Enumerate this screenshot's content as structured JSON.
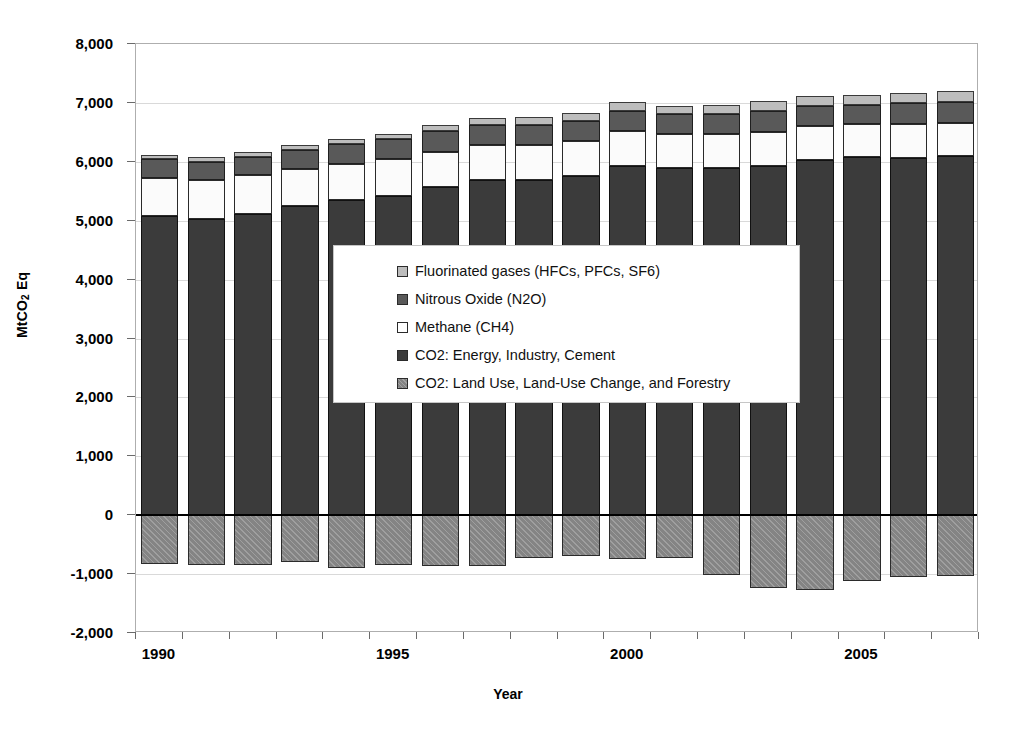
{
  "chart_data": {
    "type": "bar",
    "subtype": "stacked-bar-with-negative",
    "title": "",
    "xlabel": "Year",
    "ylabel": "MtCO2 Eq",
    "ylim": [
      -2000,
      8000
    ],
    "ytick_step": 1000,
    "ytick_labels": [
      "8,000",
      "7,000",
      "6,000",
      "5,000",
      "4,000",
      "3,000",
      "2,000",
      "1,000",
      "0",
      "-1,000",
      "-2,000"
    ],
    "ytick_values": [
      8000,
      7000,
      6000,
      5000,
      4000,
      3000,
      2000,
      1000,
      0,
      -1000,
      -2000
    ],
    "xtick_labels": [
      "1990",
      "1995",
      "2000",
      "2005"
    ],
    "xtick_values": [
      1990,
      1995,
      2000,
      2005
    ],
    "grid": true,
    "legend_position": "center",
    "categories": [
      1990,
      1991,
      1992,
      1993,
      1994,
      1995,
      1996,
      1997,
      1998,
      1999,
      2000,
      2001,
      2002,
      2003,
      2004,
      2005,
      2006,
      2007
    ],
    "series": [
      {
        "name": "CO2: Energy, Industry, Cement",
        "key": "co2_energy",
        "color": "#3b3b3b",
        "values": [
          5080,
          5030,
          5110,
          5250,
          5350,
          5420,
          5570,
          5690,
          5690,
          5760,
          5930,
          5900,
          5890,
          5930,
          6030,
          6080,
          6070,
          6100
        ]
      },
      {
        "name": "Methane (CH4)",
        "key": "ch4",
        "color": "#fbfbfb",
        "values": [
          650,
          660,
          660,
          620,
          620,
          620,
          600,
          590,
          600,
          590,
          590,
          580,
          580,
          580,
          570,
          560,
          570,
          560
        ]
      },
      {
        "name": "Nitrous Oxide (N2O)",
        "key": "n2o",
        "color": "#595959",
        "values": [
          310,
          310,
          310,
          330,
          330,
          340,
          350,
          350,
          340,
          340,
          350,
          330,
          340,
          360,
          340,
          330,
          350,
          350
        ]
      },
      {
        "name": "Fluorinated gases (HFCs, PFCs, SF6)",
        "key": "fgases",
        "color": "#bdbdbd",
        "values": [
          80,
          80,
          80,
          90,
          90,
          90,
          100,
          110,
          130,
          140,
          150,
          140,
          150,
          160,
          170,
          170,
          180,
          190
        ]
      },
      {
        "name": "CO2: Land Use, Land-Use Change, and Forestry",
        "key": "lulucf",
        "color": "#848484",
        "values": [
          -830,
          -840,
          -850,
          -790,
          -890,
          -850,
          -870,
          -860,
          -720,
          -700,
          -740,
          -730,
          -1010,
          -1230,
          -1270,
          -1110,
          -1050,
          -1040
        ]
      }
    ],
    "totals_positive": [
      6120,
      6080,
      6160,
      6290,
      6390,
      6470,
      6620,
      6740,
      6760,
      6830,
      7020,
      6950,
      6960,
      7030,
      7110,
      7140,
      7170,
      7200
    ]
  },
  "axis": {
    "y_title_prefix": "MtCO",
    "y_title_sub": "2",
    "y_title_suffix": " Eq",
    "x_title": "Year"
  },
  "legend": {
    "items": [
      {
        "label": "Fluorinated gases (HFCs, PFCs, SF6)",
        "swatch": "#bdbdbd",
        "swatch_name": "legend-swatch-fluorinated-gases"
      },
      {
        "label": "Nitrous Oxide (N2O)",
        "swatch": "#595959",
        "swatch_name": "legend-swatch-nitrous-oxide"
      },
      {
        "label": "Methane (CH4)",
        "swatch": "#ffffff",
        "swatch_name": "legend-swatch-methane"
      },
      {
        "label": "CO2: Energy, Industry, Cement",
        "swatch": "#3b3b3b",
        "swatch_name": "legend-swatch-co2-energy"
      },
      {
        "label": "CO2: Land Use, Land-Use Change, and Forestry",
        "swatch": "#848484",
        "swatch_name": "legend-swatch-co2-lulucf"
      }
    ]
  },
  "colors": {
    "fgases": "#bdbdbd",
    "n2o": "#595959",
    "ch4": "#fbfbfb",
    "co2_energy": "#3b3b3b",
    "lulucf": "#848484",
    "grid": "#d9d9d9",
    "axis": "#aeaeae",
    "zero": "#000000"
  }
}
